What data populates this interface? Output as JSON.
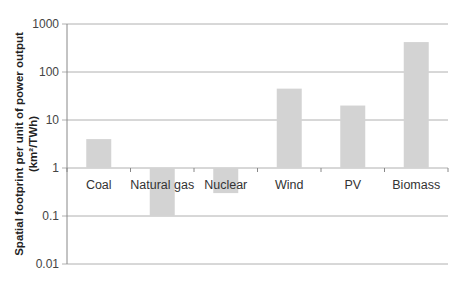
{
  "chart_data": {
    "type": "bar",
    "title": "",
    "xlabel": "",
    "ylabel": "Spatial footprint per unit of power output (km²/TWh)",
    "ylabel_line1": "Spatial footprint  per unit of power output",
    "ylabel_line2": "(km²/TWh)",
    "yscale": "log",
    "ylim": [
      0.01,
      1000
    ],
    "yticks": [
      "1000",
      "100",
      "10",
      "1",
      "0.1",
      "0.01"
    ],
    "ytick_values": [
      1000,
      100,
      10,
      1,
      0.1,
      0.01
    ],
    "bar_baseline": 1,
    "grid": true,
    "legend": null,
    "categories": [
      "Coal",
      "Natural gas",
      "Nuclear",
      "Wind",
      "PV",
      "Biomass"
    ],
    "values": [
      4,
      0.1,
      0.3,
      45,
      20,
      420
    ],
    "bar_color": "#d3d3d3",
    "grid_color": "#b0b0b0"
  }
}
